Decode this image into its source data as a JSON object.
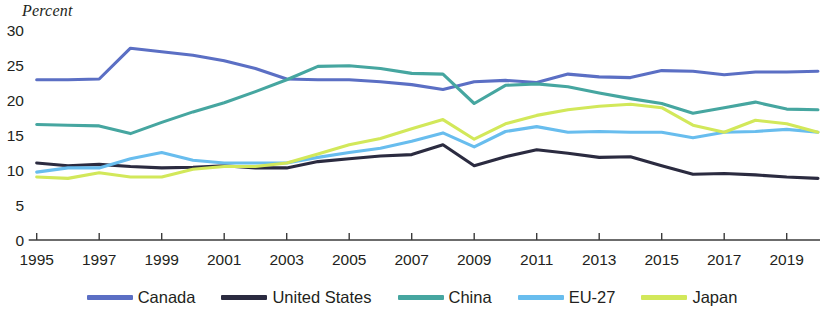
{
  "chart_data": {
    "type": "line",
    "title": "",
    "subtitle": "",
    "ylabel": "Percent",
    "xlabel": "",
    "ylim": [
      0,
      30
    ],
    "ytick_labels": [
      "0",
      "5",
      "10",
      "15",
      "20",
      "25",
      "30"
    ],
    "ytick_values": [
      0,
      5,
      10,
      15,
      20,
      25,
      30
    ],
    "grid": false,
    "legend_position": "bottom",
    "x": [
      1995,
      1996,
      1997,
      1998,
      1999,
      2000,
      2001,
      2002,
      2003,
      2004,
      2005,
      2006,
      2007,
      2008,
      2009,
      2010,
      2011,
      2012,
      2013,
      2014,
      2015,
      2016,
      2017,
      2018,
      2019,
      2020
    ],
    "xtick_labels": [
      "1995",
      "1997",
      "1999",
      "2001",
      "2003",
      "2005",
      "2007",
      "2009",
      "2011",
      "2013",
      "2015",
      "2017",
      "2019"
    ],
    "xtick_values": [
      1995,
      1997,
      1999,
      2001,
      2003,
      2005,
      2007,
      2009,
      2011,
      2013,
      2015,
      2017,
      2019
    ],
    "series": [
      {
        "name": "Canada",
        "color": "#5b6fc4",
        "values": [
          22.9,
          22.9,
          23.0,
          27.4,
          26.9,
          26.4,
          25.6,
          24.5,
          23.0,
          22.9,
          22.9,
          22.6,
          22.2,
          21.5,
          22.6,
          22.8,
          22.5,
          23.7,
          23.3,
          23.2,
          24.2,
          24.1,
          23.6,
          24.0,
          24.0,
          24.1
        ]
      },
      {
        "name": "United States",
        "color": "#2b2b40",
        "values": [
          11.0,
          10.6,
          10.8,
          10.5,
          10.3,
          10.4,
          10.6,
          10.3,
          10.3,
          11.2,
          11.6,
          12.0,
          12.2,
          13.6,
          10.6,
          11.9,
          12.9,
          12.4,
          11.8,
          11.9,
          10.6,
          9.4,
          9.5,
          9.3,
          9.0,
          8.8
        ]
      },
      {
        "name": "China",
        "color": "#46a6a0",
        "values": [
          16.5,
          16.4,
          16.3,
          15.2,
          16.8,
          18.3,
          19.6,
          21.2,
          22.9,
          24.8,
          24.9,
          24.5,
          23.8,
          23.7,
          19.5,
          22.1,
          22.3,
          21.9,
          21.0,
          20.2,
          19.5,
          18.1,
          18.9,
          19.7,
          18.7,
          18.6
        ]
      },
      {
        "name": "EU-27",
        "color": "#68bdee",
        "values": [
          9.7,
          10.3,
          10.3,
          11.6,
          12.5,
          11.4,
          11.0,
          11.0,
          11.0,
          11.8,
          12.5,
          13.1,
          14.1,
          15.3,
          13.3,
          15.5,
          16.2,
          15.4,
          15.5,
          15.4,
          15.4,
          14.6,
          15.4,
          15.5,
          15.8,
          15.4
        ]
      },
      {
        "name": "Japan",
        "color": "#d2e85a",
        "values": [
          9.0,
          8.8,
          9.6,
          9.0,
          9.0,
          10.1,
          10.5,
          10.5,
          11.0,
          12.3,
          13.6,
          14.5,
          15.9,
          17.2,
          14.4,
          16.6,
          17.8,
          18.6,
          19.1,
          19.4,
          18.9,
          16.4,
          15.4,
          17.1,
          16.6,
          15.4
        ]
      }
    ]
  },
  "legend": {
    "items": [
      {
        "label": "Canada",
        "color": "#5b6fc4"
      },
      {
        "label": "United States",
        "color": "#2b2b40"
      },
      {
        "label": "China",
        "color": "#46a6a0"
      },
      {
        "label": "EU-27",
        "color": "#68bdee"
      },
      {
        "label": "Japan",
        "color": "#d2e85a"
      }
    ]
  }
}
